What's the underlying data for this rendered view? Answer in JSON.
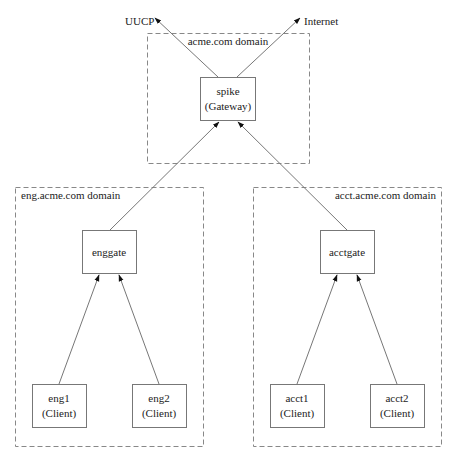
{
  "external": {
    "uucp": "UUCP",
    "internet": "Internet"
  },
  "domains": {
    "top": {
      "label": "acme.com domain"
    },
    "eng": {
      "label": "eng.acme.com domain"
    },
    "acct": {
      "label": "acct.acme.com domain"
    }
  },
  "nodes": {
    "spike": {
      "line1": "spike",
      "line2": "(Gateway)"
    },
    "enggate": {
      "line1": "enggate"
    },
    "acctgate": {
      "line1": "acctgate"
    },
    "eng1": {
      "line1": "eng1",
      "line2": "(Client)"
    },
    "eng2": {
      "line1": "eng2",
      "line2": "(Client)"
    },
    "acct1": {
      "line1": "acct1",
      "line2": "(Client)"
    },
    "acct2": {
      "line1": "acct2",
      "line2": "(Client)"
    }
  },
  "colors": {
    "line": "#777777",
    "box": "#777777",
    "text": "#222222"
  }
}
